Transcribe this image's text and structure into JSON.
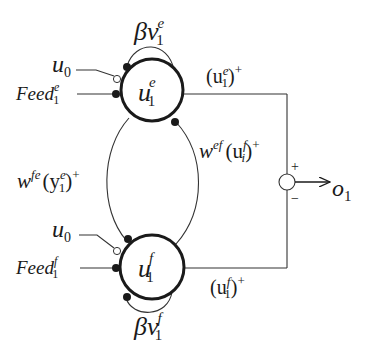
{
  "diagram": {
    "type": "coupled-neuron-oscillator",
    "colors": {
      "stroke": "#1a1a1a",
      "background": "#ffffff"
    },
    "neurons": [
      {
        "id": "extensor",
        "label_base": "u",
        "label_sub": "1",
        "label_sup": "e",
        "self_inhibition": {
          "base": "βv",
          "sub": "1",
          "sup": "e"
        },
        "bias_input": {
          "base": "u",
          "sub": "0"
        },
        "feed_input": {
          "base": "Feed",
          "sub": "1",
          "sup": "e"
        },
        "output": {
          "open": "(u",
          "sub": "1",
          "sup": "e",
          "close": ")",
          "plus": "+"
        }
      },
      {
        "id": "flexor",
        "label_base": "u",
        "label_sub": "1",
        "label_sup": "f",
        "self_inhibition": {
          "base": "βv",
          "sub": "1",
          "sup": "f"
        },
        "bias_input": {
          "base": "u",
          "sub": "0"
        },
        "feed_input": {
          "base": "Feed",
          "sub": "1",
          "sup": "f"
        },
        "output": {
          "open": "(u",
          "sub": "1",
          "sup": "f",
          "close": ")",
          "plus": "+"
        }
      }
    ],
    "mutual_inhibition": {
      "left": {
        "w": "w",
        "w_sup": "fe",
        "open": "(y",
        "sub": "1",
        "sup": "e",
        "close": ")",
        "plus": "+"
      },
      "right": {
        "w": "w",
        "w_sup": "ef",
        "open": "(u",
        "sub": "i",
        "sup": "f",
        "close": ")",
        "plus": "+"
      }
    },
    "summation": {
      "plus_sign": "+",
      "minus_sign": "−",
      "output": {
        "base": "o",
        "sub": "1"
      }
    }
  }
}
